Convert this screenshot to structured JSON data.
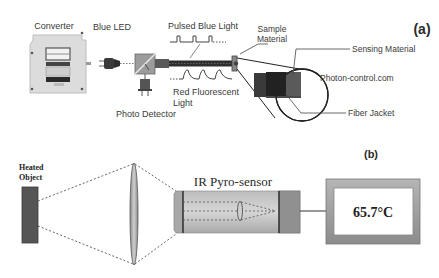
{
  "panel_a": {
    "label": "(a)",
    "converter_label": "Converter",
    "blue_led_label": "Blue LED",
    "pulsed_light_label": "Pulsed Blue Light",
    "red_light_label_line1": "Red Fluorescent",
    "red_light_label_line2": "Light",
    "photo_detector_label": "Photo Detector",
    "sample_material_line1": "Sample",
    "sample_material_line2": "Material",
    "sensing_material_label": "Sensing Material",
    "source_credit": "Photon-control.com",
    "fiber_jacket_label": "Fiber Jacket"
  },
  "panel_b": {
    "label": "(b)",
    "heated_object_line1": "Heated",
    "heated_object_line2": "Object",
    "sensor_label": "IR Pyro-sensor",
    "display_value": "65.7°C"
  },
  "colors": {
    "dark_gray": "#4a4a4a",
    "mid_gray": "#9a9a9a",
    "light_gray": "#d4d4d4",
    "fiber": "#2e2e2e",
    "white": "#ffffff"
  }
}
